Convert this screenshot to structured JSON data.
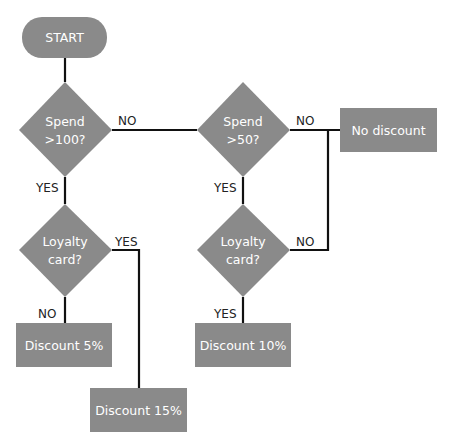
{
  "diagram": {
    "type": "flowchart",
    "colors": {
      "node_fill": "#8a8a8a",
      "node_text": "#ffffff",
      "edge": "#111111",
      "label": "#222222",
      "background": "#ffffff"
    },
    "nodes": {
      "start": {
        "label": "START",
        "shape": "rounded-rect"
      },
      "spend100": {
        "line1": "Spend",
        "line2": ">100?",
        "shape": "diamond"
      },
      "spend50": {
        "line1": "Spend",
        "line2": ">50?",
        "shape": "diamond"
      },
      "loyalty1": {
        "line1": "Loyalty",
        "line2": "card?",
        "shape": "diamond"
      },
      "loyalty2": {
        "line1": "Loyalty",
        "line2": "card?",
        "shape": "diamond"
      },
      "no_discount": {
        "label": "No discount",
        "shape": "rect"
      },
      "discount5": {
        "label": "Discount 5%",
        "shape": "rect"
      },
      "discount10": {
        "label": "Discount 10%",
        "shape": "rect"
      },
      "discount15": {
        "label": "Discount 15%",
        "shape": "rect"
      }
    },
    "edges": [
      {
        "from": "start",
        "to": "spend100",
        "label": ""
      },
      {
        "from": "spend100",
        "to": "spend50",
        "label": "NO"
      },
      {
        "from": "spend100",
        "to": "loyalty1",
        "label": "YES"
      },
      {
        "from": "spend50",
        "to": "no_discount",
        "label": "NO"
      },
      {
        "from": "spend50",
        "to": "loyalty2",
        "label": "YES"
      },
      {
        "from": "loyalty1",
        "to": "discount5",
        "label": "NO"
      },
      {
        "from": "loyalty1",
        "to": "discount15",
        "label": "YES"
      },
      {
        "from": "loyalty2",
        "to": "discount10",
        "label": "YES"
      },
      {
        "from": "loyalty2",
        "to": "no_discount",
        "label": "NO"
      }
    ]
  }
}
